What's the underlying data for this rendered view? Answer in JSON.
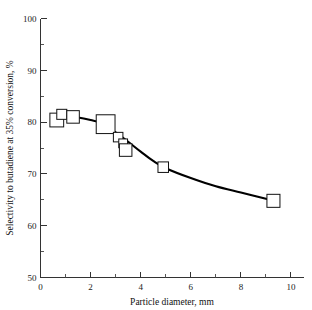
{
  "chart_data": {
    "type": "scatter",
    "title": "",
    "xlabel": "Particle diameter, mm",
    "ylabel": "Selectivity to butadiene at 35% conversion, %",
    "xlim": [
      0,
      10.5
    ],
    "ylim": [
      50,
      100
    ],
    "grid": false,
    "legend": "none",
    "xticks": [
      0,
      2,
      4,
      6,
      8,
      10
    ],
    "xtick_labels": [
      "0",
      "2",
      "4",
      "6",
      "8",
      "10"
    ],
    "xticks_minor": [
      1,
      3,
      5,
      7,
      9
    ],
    "yticks": [
      50,
      60,
      70,
      80,
      90,
      100
    ],
    "ytick_labels": [
      "50",
      "60",
      "70",
      "80",
      "90",
      "100"
    ],
    "yticks_minor": [
      55,
      65,
      75,
      85,
      95
    ],
    "marker_style": "open-square",
    "x": [
      0.65,
      0.85,
      1.3,
      2.6,
      3.1,
      3.3,
      3.4,
      4.9,
      9.3
    ],
    "y": [
      80.4,
      81.5,
      81.0,
      79.6,
      77.1,
      75.9,
      74.6,
      71.3,
      64.8
    ],
    "marker_sizes_mm": [
      0.55,
      0.4,
      0.5,
      0.75,
      0.38,
      0.35,
      0.5,
      0.42,
      0.52
    ],
    "points": [
      {
        "x": 0.65,
        "y": 80.4,
        "size": 0.55
      },
      {
        "x": 0.85,
        "y": 81.5,
        "size": 0.4
      },
      {
        "x": 1.3,
        "y": 81.0,
        "size": 0.5
      },
      {
        "x": 2.6,
        "y": 79.6,
        "size": 0.75
      },
      {
        "x": 3.1,
        "y": 77.1,
        "size": 0.38
      },
      {
        "x": 3.3,
        "y": 75.9,
        "size": 0.35
      },
      {
        "x": 3.4,
        "y": 74.6,
        "size": 0.5
      },
      {
        "x": 4.9,
        "y": 71.3,
        "size": 0.42
      },
      {
        "x": 9.3,
        "y": 64.8,
        "size": 0.52
      }
    ],
    "curve": [
      {
        "x": 0.55,
        "y": 80.9
      },
      {
        "x": 1.0,
        "y": 81.1
      },
      {
        "x": 1.5,
        "y": 80.9
      },
      {
        "x": 2.0,
        "y": 80.4
      },
      {
        "x": 2.5,
        "y": 79.7
      },
      {
        "x": 3.0,
        "y": 78.0
      },
      {
        "x": 3.5,
        "y": 76.2
      },
      {
        "x": 4.0,
        "y": 74.3
      },
      {
        "x": 4.5,
        "y": 72.5
      },
      {
        "x": 5.0,
        "y": 71.1
      },
      {
        "x": 6.0,
        "y": 69.2
      },
      {
        "x": 7.0,
        "y": 67.6
      },
      {
        "x": 8.0,
        "y": 66.4
      },
      {
        "x": 9.0,
        "y": 65.2
      },
      {
        "x": 9.4,
        "y": 64.8
      }
    ],
    "colors": {
      "curve": "#000000",
      "marker_stroke": "#111111",
      "marker_fill": "#ffffff",
      "axis": "#333333",
      "text": "#1a1a1a",
      "background": "#ffffff"
    }
  }
}
